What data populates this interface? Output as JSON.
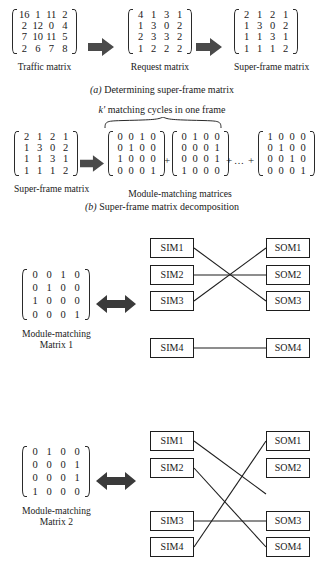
{
  "figure": {
    "panel_a": {
      "caption": "(a) Determining super-frame matrix",
      "caption_prefix": "(a)",
      "caption_rest": " Determining super-frame matrix",
      "matrices": [
        {
          "label": "Traffic matrix",
          "rows": [
            [
              "16",
              "1",
              "11",
              "2"
            ],
            [
              "2",
              "12",
              "0",
              "4"
            ],
            [
              "7",
              "10",
              "11",
              "5"
            ],
            [
              "2",
              "6",
              "7",
              "8"
            ]
          ]
        },
        {
          "label": "Request matrix",
          "rows": [
            [
              "4",
              "1",
              "3",
              "1"
            ],
            [
              "1",
              "3",
              "0",
              "2"
            ],
            [
              "2",
              "3",
              "3",
              "2"
            ],
            [
              "1",
              "2",
              "2",
              "2"
            ]
          ]
        },
        {
          "label": "Super-frame matrix",
          "rows": [
            [
              "2",
              "1",
              "2",
              "1"
            ],
            [
              "1",
              "3",
              "0",
              "2"
            ],
            [
              "1",
              "1",
              "3",
              "1"
            ],
            [
              "1",
              "1",
              "1",
              "2"
            ]
          ]
        }
      ],
      "arrow1": "right-block-arrow",
      "arrow2": "right-block-arrow"
    },
    "panel_b": {
      "heading_prefix": "k'",
      "heading_rest": " matching cycles in one frame",
      "heading": "k' matching cycles in one frame",
      "caption_prefix": "(b)",
      "caption_rest": " Super-frame matrix decomposition",
      "caption": "(b) Super-frame matrix decomposition",
      "source_matrix": {
        "label": "Super-frame matrix",
        "rows": [
          [
            "2",
            "1",
            "2",
            "1"
          ],
          [
            "1",
            "3",
            "0",
            "2"
          ],
          [
            "1",
            "1",
            "3",
            "1"
          ],
          [
            "1",
            "1",
            "1",
            "2"
          ]
        ]
      },
      "group_label": "Module-matching matrices",
      "plus1": "+",
      "plus2": "+",
      "ellipsis": "…",
      "plus3": "+",
      "decomposition": [
        {
          "rows": [
            [
              "0",
              "0",
              "1",
              "0"
            ],
            [
              "0",
              "1",
              "0",
              "0"
            ],
            [
              "1",
              "0",
              "0",
              "0"
            ],
            [
              "0",
              "0",
              "0",
              "1"
            ]
          ]
        },
        {
          "rows": [
            [
              "0",
              "1",
              "0",
              "0"
            ],
            [
              "0",
              "0",
              "0",
              "1"
            ],
            [
              "0",
              "0",
              "0",
              "1"
            ],
            [
              "1",
              "0",
              "0",
              "0"
            ]
          ]
        },
        {
          "rows": [
            [
              "1",
              "0",
              "0",
              "0"
            ],
            [
              "0",
              "1",
              "0",
              "0"
            ],
            [
              "0",
              "0",
              "1",
              "0"
            ],
            [
              "0",
              "0",
              "0",
              "1"
            ]
          ]
        }
      ]
    },
    "panel_c": {
      "matrix": {
        "label_line1": "Module-matching",
        "label_line2": "Matrix 1",
        "rows": [
          [
            "0",
            "0",
            "1",
            "0"
          ],
          [
            "0",
            "1",
            "0",
            "0"
          ],
          [
            "1",
            "0",
            "0",
            "0"
          ],
          [
            "0",
            "0",
            "0",
            "1"
          ]
        ]
      },
      "arrow": "double-headed-arrow",
      "inputs": [
        "SIM1",
        "SIM2",
        "SIM3",
        "SIM4"
      ],
      "outputs": [
        "SOM1",
        "SOM2",
        "SOM3",
        "SOM4"
      ],
      "connections": [
        {
          "from": "SIM1",
          "to": "SOM3"
        },
        {
          "from": "SIM2",
          "to": "SOM2"
        },
        {
          "from": "SIM3",
          "to": "SOM1"
        },
        {
          "from": "SIM4",
          "to": "SOM4"
        }
      ]
    },
    "panel_d": {
      "matrix": {
        "label_line1": "Module-matching",
        "label_line2": "Matrix 2",
        "rows": [
          [
            "0",
            "1",
            "0",
            "0"
          ],
          [
            "0",
            "0",
            "0",
            "1"
          ],
          [
            "0",
            "0",
            "0",
            "1"
          ],
          [
            "1",
            "0",
            "0",
            "0"
          ]
        ]
      },
      "arrow": "double-headed-arrow",
      "inputs": [
        "SIM1",
        "SIM2",
        "SIM3",
        "SIM4"
      ],
      "outputs": [
        "SOM1",
        "SOM2",
        "SOM3",
        "SOM4"
      ],
      "connections": [
        {
          "from": "SIM1",
          "to": "SOM2"
        },
        {
          "from": "SIM2",
          "to": "SOM4"
        },
        {
          "from": "SIM3",
          "to": "SOM3"
        },
        {
          "from": "SIM4",
          "to": "SOM1"
        }
      ]
    },
    "colors": {
      "arrow_fill": "#4a4a4a",
      "line": "#1d1d1d",
      "text": "#1a1a1a",
      "background": "#ffffff"
    }
  }
}
